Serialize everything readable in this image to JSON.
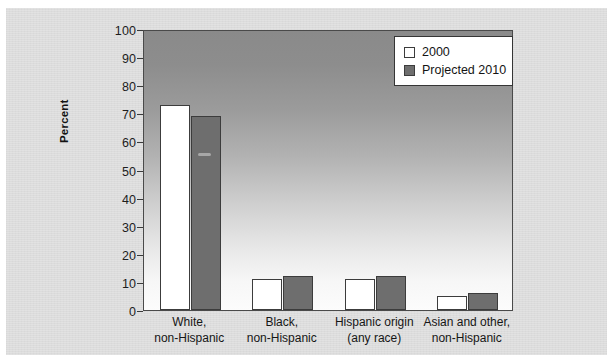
{
  "chart_data": {
    "type": "bar",
    "title": "",
    "xlabel": "",
    "ylabel": "Percent",
    "ylim": [
      0,
      100
    ],
    "yticks": [
      0,
      10,
      20,
      30,
      40,
      50,
      60,
      70,
      80,
      90,
      100
    ],
    "ytick_labels": [
      "0",
      "10",
      "20",
      "30",
      "40",
      "50",
      "60",
      "70",
      "80",
      "90",
      "100"
    ],
    "grid": false,
    "legend_position": "top-right",
    "categories": [
      "White,\nnon-Hispanic",
      "Black,\nnon-Hispanic",
      "Hispanic origin\n(any race)",
      "Asian and other,\nnon-Hispanic"
    ],
    "category_lines": [
      [
        "White,",
        "non-Hispanic"
      ],
      [
        "Black,",
        "non-Hispanic"
      ],
      [
        "Hispanic origin",
        "(any race)"
      ],
      [
        "Asian and other,",
        "non-Hispanic"
      ]
    ],
    "series": [
      {
        "name": "2000",
        "values": [
          73,
          11,
          11,
          5
        ],
        "color": "#ffffff"
      },
      {
        "name": "Projected 2010",
        "values": [
          69,
          12,
          12,
          6
        ],
        "color": "#6e6e6e"
      }
    ]
  },
  "legend": {
    "items": [
      {
        "label": "2000",
        "swatch": "s2000"
      },
      {
        "label": "Projected 2010",
        "swatch": "s2010"
      }
    ]
  },
  "colors": {
    "page_background": "#ffffff",
    "card_background": "#dcdcdc",
    "plot_gradient_top": "#8a8a8a",
    "plot_gradient_bottom": "#fcfcfc",
    "bar_2000": "#ffffff",
    "bar_2010": "#6e6e6e",
    "bar_outline": "#3c3c3c",
    "axis": "#4a4a4a",
    "text": "#161616"
  }
}
